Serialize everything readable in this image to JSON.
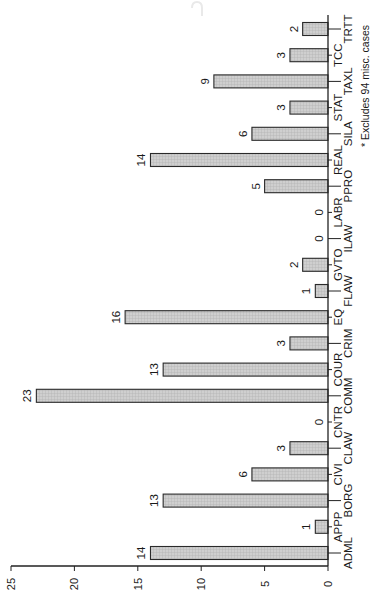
{
  "chart_data": {
    "type": "bar",
    "orientation": "rotated-90-ccw (vertical bars printed sideways)",
    "title": "",
    "xlabel": "",
    "ylabel": "",
    "categories": [
      "ADML",
      "APPP",
      "BORG",
      "CIVI",
      "CLAW",
      "CNTR",
      "COMM",
      "COUR",
      "CRIM",
      "EQ",
      "FLAW",
      "GVTO",
      "ILAW",
      "LABR",
      "PPRO",
      "REAL",
      "SILA",
      "STAT",
      "TAXL",
      "TCC",
      "TRTT"
    ],
    "values": [
      14,
      1,
      13,
      6,
      3,
      0,
      23,
      13,
      3,
      16,
      1,
      2,
      0,
      0,
      5,
      14,
      6,
      3,
      9,
      3,
      2
    ],
    "data_labels": [
      "14",
      "1",
      "13",
      "6",
      "3",
      "0",
      "23",
      "13",
      "3",
      "16",
      "1",
      "2",
      "0",
      "0",
      "5",
      "14",
      "6",
      "3",
      "9",
      "3",
      "2"
    ],
    "ylim": [
      0,
      25
    ],
    "yticks": [
      "0",
      "5",
      "10",
      "15",
      "20",
      "25"
    ],
    "grid": false,
    "legend": null,
    "footnote": "* Excludes 94 misc. cases",
    "bar_fill": "#c9c9c9",
    "bar_stroke": "#2a2a2a"
  }
}
